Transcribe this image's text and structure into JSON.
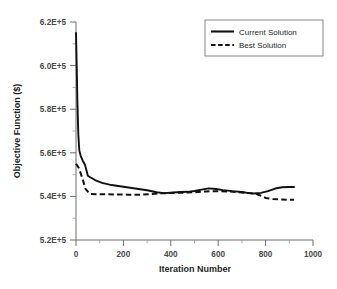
{
  "chart_data": {
    "type": "line",
    "title": "",
    "xlabel": "Iteration Number",
    "ylabel": "Objective Function ($)",
    "xlim": [
      0,
      1000
    ],
    "ylim": [
      520000,
      620000
    ],
    "xticks": [
      0,
      200,
      400,
      600,
      800,
      1000
    ],
    "xticklabels": [
      "0",
      "200",
      "400",
      "600",
      "800",
      "1000"
    ],
    "xminor_step": 100,
    "yticks": [
      520000,
      540000,
      560000,
      580000,
      600000,
      620000
    ],
    "yticklabels": [
      "5.2E+5",
      "5.4E+5",
      "5.6E+5",
      "5.8E+5",
      "6.0E+5",
      "6.2E+5"
    ],
    "yminor_step": 10000,
    "grid": false,
    "legend_position": "upper right",
    "series": [
      {
        "name": "Current Solution",
        "style": "solid",
        "color": "#111111",
        "x": [
          0,
          3,
          6,
          10,
          14,
          20,
          28,
          38,
          50,
          60,
          80,
          110,
          150,
          200,
          250,
          300,
          340,
          370,
          400,
          440,
          470,
          500,
          530,
          560,
          590,
          620,
          660,
          700,
          730,
          750,
          780,
          810,
          840,
          870,
          900,
          920
        ],
        "y": [
          615000,
          600000,
          583000,
          568000,
          561000,
          558500,
          556500,
          554500,
          549500,
          548800,
          547500,
          546200,
          545200,
          544400,
          543600,
          542800,
          541900,
          541500,
          541700,
          542000,
          542100,
          542500,
          543100,
          543700,
          543400,
          542900,
          542400,
          542000,
          541500,
          541300,
          541600,
          542400,
          543600,
          544200,
          544300,
          544300
        ]
      },
      {
        "name": "Best Solution",
        "style": "dashed",
        "color": "#111111",
        "x": [
          0,
          12,
          25,
          40,
          50,
          60,
          100,
          160,
          220,
          280,
          320,
          360,
          400,
          450,
          500,
          550,
          600,
          650,
          700,
          740,
          760,
          780,
          800,
          830,
          860,
          890,
          920
        ],
        "y": [
          555000,
          553000,
          549000,
          543500,
          542200,
          541100,
          541000,
          540900,
          540800,
          540800,
          541100,
          541400,
          541600,
          541700,
          541900,
          542300,
          542400,
          542200,
          541800,
          541400,
          541200,
          540300,
          539300,
          538800,
          538600,
          538500,
          538500
        ]
      }
    ]
  },
  "legend": {
    "items": [
      {
        "label": "Current Solution",
        "style": "solid"
      },
      {
        "label": "Best Solution",
        "style": "dashed"
      }
    ]
  }
}
